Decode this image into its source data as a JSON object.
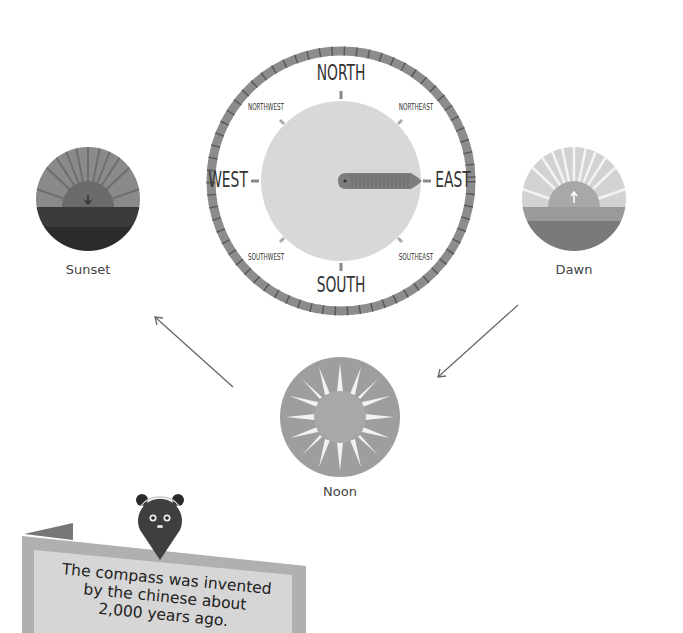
{
  "compass": {
    "north": "NORTH",
    "south": "SOUTH",
    "east": "EAST",
    "west": "WEST",
    "northeast": "NORTHEAST",
    "northwest": "NORTHWEST",
    "southeast": "SOUTHEAST",
    "southwest": "SOUTHWEST"
  },
  "suns": {
    "sunset": "Sunset",
    "dawn": "Dawn",
    "noon": "Noon"
  },
  "banner": {
    "line1": "The compass was invented",
    "line2": "by the chinese about",
    "line3": "2,000 years ago."
  },
  "colors": {
    "ring": "#8a8a8a",
    "face": "#d6d6d6",
    "needle": "#7a7a7a"
  }
}
